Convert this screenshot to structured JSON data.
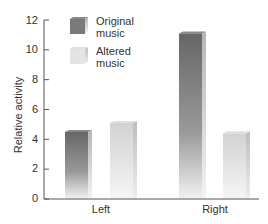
{
  "chart_data": {
    "type": "bar",
    "title": "",
    "xlabel": "",
    "ylabel": "Relative activity",
    "ylim": [
      0,
      12
    ],
    "yticks": [
      0,
      2,
      4,
      6,
      8,
      10,
      12
    ],
    "categories": [
      "Left",
      "Right"
    ],
    "series": [
      {
        "name": "Original music",
        "values": [
          4.5,
          11.1
        ],
        "color": "#6e6e6e"
      },
      {
        "name": "Altered music",
        "values": [
          5.1,
          4.4
        ],
        "color": "#d9d9d9"
      }
    ],
    "legend": {
      "position": "upper-left",
      "entries": [
        "Original music",
        "Altered music"
      ]
    },
    "grid": false
  },
  "legend": {
    "original_line1": "Original",
    "original_line2": "music",
    "altered_line1": "Altered",
    "altered_line2": "music"
  },
  "axis": {
    "ylabel": "Relative activity",
    "ticks": [
      "0",
      "2",
      "4",
      "6",
      "8",
      "10",
      "12"
    ],
    "categories": [
      "Left",
      "Right"
    ]
  }
}
